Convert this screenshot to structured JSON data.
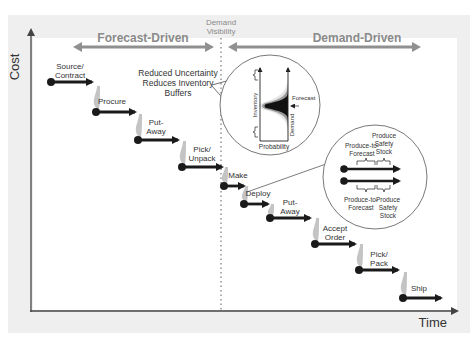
{
  "colors": {
    "frame": "#efefef",
    "plot": "#ffffff",
    "axis": "#555555",
    "phase_arrow": "#8f8f8f",
    "phase_label": "#8a8a8a",
    "step_arrow": "#1a1a1a",
    "step_shadow": "#c4c4c4",
    "dotted_line": "#9a9a9a",
    "text": "#333333"
  },
  "axes": {
    "y_label": "Cost",
    "x_label": "Time"
  },
  "divider": {
    "label_line1": "Demand",
    "label_line2": "Visibility"
  },
  "phases": {
    "forecast_driven": "Forecast-Driven",
    "demand_driven": "Demand-Driven"
  },
  "steps": [
    {
      "line1": "Source/",
      "line2": "Contract",
      "x": 51,
      "y": 82,
      "x2": 92,
      "lx": 70,
      "ly": 69
    },
    {
      "line1": "Procure",
      "line2": "",
      "x": 96,
      "y": 112,
      "x2": 135,
      "lx": 112,
      "ly": 104
    },
    {
      "line1": "Put-",
      "line2": "Away",
      "x": 138,
      "y": 140,
      "x2": 178,
      "lx": 156,
      "ly": 125
    },
    {
      "line1": "Pick/",
      "line2": "Unpack",
      "x": 182,
      "y": 167,
      "x2": 222,
      "lx": 202,
      "ly": 152
    },
    {
      "line1": "Make",
      "line2": "",
      "x": 224,
      "y": 186,
      "x2": 244,
      "lx": 238,
      "ly": 178
    },
    {
      "line1": "Deploy",
      "line2": "",
      "x": 244,
      "y": 204,
      "x2": 268,
      "lx": 258,
      "ly": 196
    },
    {
      "line1": "Put-",
      "line2": "Away",
      "x": 270,
      "y": 218,
      "x2": 310,
      "lx": 290,
      "ly": 205
    },
    {
      "line1": "Accept",
      "line2": "Order",
      "x": 315,
      "y": 244,
      "x2": 355,
      "lx": 335,
      "ly": 231
    },
    {
      "line1": "Pick/",
      "line2": "Pack",
      "x": 359,
      "y": 270,
      "x2": 398,
      "lx": 379,
      "ly": 257
    },
    {
      "line1": "Ship",
      "line2": "",
      "x": 403,
      "y": 298,
      "x2": 441,
      "lx": 419,
      "ly": 291
    }
  ],
  "callout_uncertainty": {
    "line1": "Reduced Uncertainty",
    "line2": "Reduces Inventory",
    "line3": "Buffers",
    "inventory_label": "Inventory",
    "probability_label": "Probability",
    "demand_label": "Demand",
    "forecast_label": "Forecast"
  },
  "callout_buffers": {
    "top_left": {
      "line1": "Produce-to-",
      "line2": "Forecast"
    },
    "top_right": {
      "line1": "Produce",
      "line2": "Safety",
      "line3": "Stock"
    },
    "bottom_left": {
      "line1": "Produce-to-",
      "line2": "Forecast"
    },
    "bottom_right": {
      "line1": "Produce",
      "line2": "Safety",
      "line3": "Stock"
    }
  }
}
